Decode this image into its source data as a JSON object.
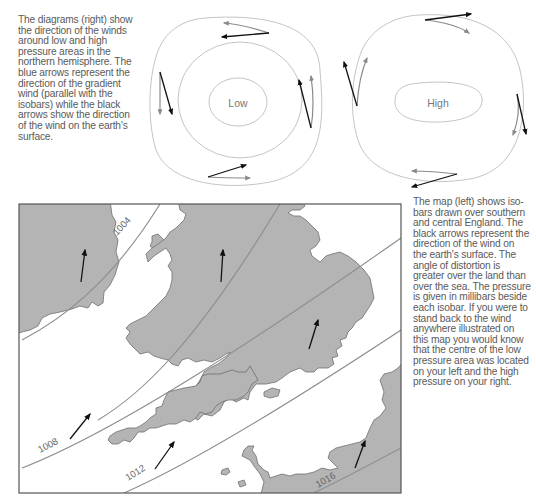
{
  "top_text": {
    "lines": [
      "The diagrams (right) show",
      "the direction of the winds",
      "around low and high",
      "pressure areas in the",
      "northern hemisphere. The",
      "blue arrows represent the",
      "direction of the gradient",
      "wind (parallel with the",
      "isobars) while the black",
      "arrows show the direction",
      "of the wind on the earth's",
      "surface."
    ]
  },
  "diagrams": {
    "low": {
      "label": "Low"
    },
    "high": {
      "label": "High"
    },
    "colors": {
      "gradient_arrow": "#8a8a8a",
      "surface_arrow": "#111111",
      "isobar": "#bdbdbd"
    }
  },
  "map": {
    "isobars": [
      {
        "label": "1004"
      },
      {
        "label": "1008"
      },
      {
        "label": "1012"
      },
      {
        "label": "1016"
      }
    ],
    "colors": {
      "land": "#b4b4b4",
      "sea": "#ffffff",
      "coast": "#6e6e6e",
      "isobar": "#8c8c8c",
      "arrow": "#111111",
      "border": "#555555"
    }
  },
  "right_text": {
    "lines": [
      "The map (left) shows iso-",
      "bars drawn over southern",
      "and central England. The",
      "black arrows represent the",
      "direction of the wind on",
      "the earth's surface. The",
      "angle of distortion is",
      "greater over the land than",
      "over the sea. The pressure",
      "is given in millibars beside",
      "each isobar. If you were to",
      "stand back to the wind",
      "anywhere illustrated on",
      "this map you would know",
      "that the centre of the low",
      "pressure area was located",
      "on your left and the high",
      "pressure on your right."
    ]
  }
}
